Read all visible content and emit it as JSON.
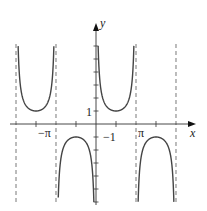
{
  "chart_data": {
    "type": "line",
    "title": "",
    "function": "y = csc x",
    "xlabel": "x",
    "ylabel": "y",
    "xlim": [
      -7.54,
      7.54
    ],
    "ylim": [
      -6.2,
      7.8
    ],
    "x_tick_labels": [
      {
        "value": -3.14159,
        "label": "−π"
      },
      {
        "value": 3.14159,
        "label": "π"
      }
    ],
    "y_tick_labels": [
      {
        "value": 1,
        "label": "1"
      },
      {
        "value": -1,
        "label": "−1"
      }
    ],
    "x_ticks": [
      -4.712,
      -1.571,
      1.571,
      4.712
    ],
    "y_ticks": [
      -6,
      -5,
      -4,
      -3,
      -2,
      -1,
      1,
      2,
      3,
      4,
      5,
      6
    ],
    "asymptotes": [
      -6.283,
      -3.142,
      3.142,
      6.283
    ],
    "series": [
      {
        "name": "csc x branch",
        "domain": [
          -6.283,
          -3.142
        ],
        "min_point": [
          -4.712,
          1
        ]
      },
      {
        "name": "csc x branch",
        "domain": [
          -3.142,
          0
        ],
        "max_point": [
          -1.571,
          -1
        ]
      },
      {
        "name": "csc x branch",
        "domain": [
          0,
          3.142
        ],
        "min_point": [
          1.571,
          1
        ]
      },
      {
        "name": "csc x branch",
        "domain": [
          3.142,
          6.283
        ],
        "max_point": [
          4.712,
          -1
        ]
      }
    ],
    "grid": false,
    "legend": null
  },
  "layout": {
    "origin_px": [
      96,
      124
    ],
    "px_per_pi": 40,
    "px_per_unit_y": 13,
    "curve_top_px": 45,
    "curve_bottom_px": 202,
    "asym_top_px": 44,
    "asym_bottom_px": 204,
    "xaxis_px": [
      10,
      196
    ],
    "yaxis_px": [
      205,
      23
    ],
    "color": "#333333"
  },
  "labels": {
    "x_axis": "x",
    "y_axis": "y",
    "neg_pi": "−π",
    "pi": "π",
    "one": "1",
    "neg_one": "−1"
  }
}
